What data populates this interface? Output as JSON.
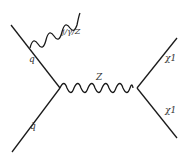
{
  "diagram": {
    "type": "feynman",
    "labels": {
      "quark": "q",
      "antiquark": "q̄",
      "boson": "Z",
      "radiation": "j/γ/Z",
      "chi_top": "χ1",
      "chi_bottom": "χ1"
    },
    "colors": {
      "line": "#1a1a1a",
      "text": "#333333"
    }
  }
}
